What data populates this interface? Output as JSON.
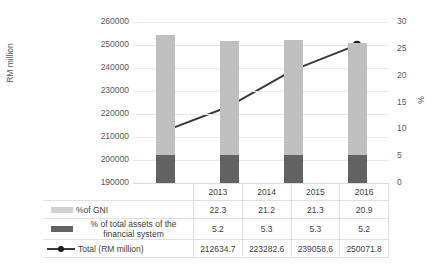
{
  "chart_data": {
    "type": "bar",
    "title": "",
    "subtitle": "",
    "categories": [
      "2013",
      "2014",
      "2015",
      "2016"
    ],
    "xlabel": "",
    "ylabel": "RM million",
    "y2label": "%",
    "ylim": [
      190000,
      260000
    ],
    "y2lim": [
      0,
      30
    ],
    "yticks": [
      "260000",
      "250000",
      "240000",
      "230000",
      "220000",
      "210000",
      "200000",
      "190000"
    ],
    "ytick_values": [
      260000,
      250000,
      240000,
      230000,
      220000,
      210000,
      200000,
      190000
    ],
    "y2ticks": [
      "30",
      "25",
      "20",
      "15",
      "10",
      "5",
      "0"
    ],
    "y2tick_values": [
      30,
      25,
      20,
      15,
      10,
      5,
      0
    ],
    "grid": true,
    "legend_position": "data-table",
    "stacked": true,
    "series": [
      {
        "name": "%of GNI",
        "type": "bar-segment",
        "axis": "y2",
        "color": "#bfbfbf",
        "values": [
          22.3,
          21.2,
          21.3,
          20.9
        ],
        "labels": [
          "22.3",
          "21.2",
          "21.3",
          "20.9"
        ]
      },
      {
        "name": "% of total assets of the financial system",
        "type": "bar-segment",
        "axis": "y2",
        "color": "#636363",
        "values": [
          5.2,
          5.3,
          5.3,
          5.2
        ],
        "labels": [
          "5.2",
          "5.3",
          "5.3",
          "5.2"
        ]
      },
      {
        "name": "Total (RM million)",
        "type": "line",
        "axis": "y",
        "color": "#3a3a3a",
        "marker": "circle",
        "values": [
          212634.7,
          223282.6,
          239058.6,
          250071.8
        ],
        "labels": [
          "212634.7",
          "223282.6",
          "239058.6",
          "250071.8"
        ]
      }
    ]
  },
  "table": {
    "header_row_label": "",
    "rows": [
      {
        "label": "",
        "marker": "none",
        "values": [
          "2013",
          "2014",
          "2015",
          "2016"
        ]
      },
      {
        "label": "%of GNI",
        "marker": "swatch-light",
        "values": [
          "22.3",
          "21.2",
          "21.3",
          "20.9"
        ]
      },
      {
        "label": "% of total assets of the financial system",
        "marker": "swatch-dark",
        "values": [
          "5.2",
          "5.3",
          "5.3",
          "5.2"
        ]
      },
      {
        "label": "Total (RM million)",
        "marker": "line-marker",
        "values": [
          "212634.7",
          "223282.6",
          "239058.6",
          "250071.8"
        ]
      }
    ]
  },
  "colors": {
    "gni": "#bfbfbf",
    "assets": "#636363",
    "line": "#3a3a3a",
    "grid": "#e8e8e8",
    "text": "#4d4d4d",
    "table_border": "#e0e0e0"
  }
}
